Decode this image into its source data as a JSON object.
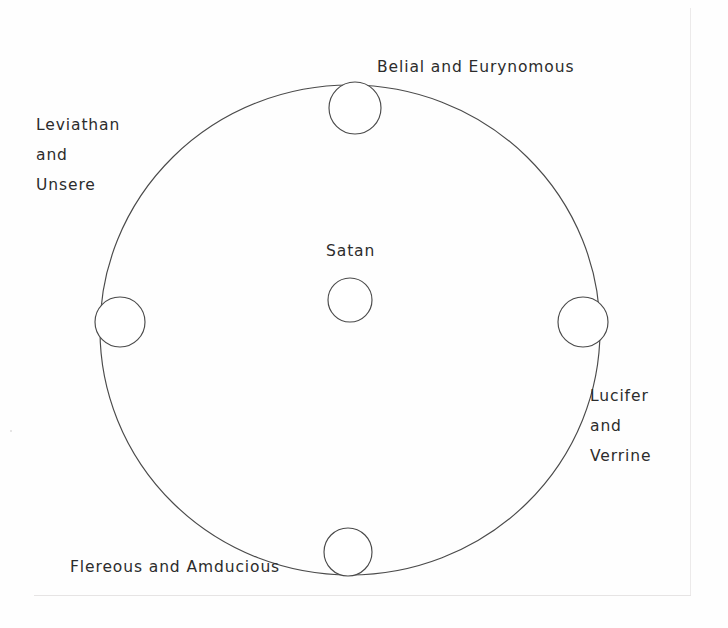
{
  "diagram": {
    "type": "circle-diagram",
    "stroke_color": "#4a4a4a",
    "text_color": "#2c2c2c",
    "background_color": "#fefefe",
    "center_node": {
      "id": "satan",
      "label": "Satan",
      "cx": 350,
      "cy": 300,
      "r": 22
    },
    "ring": {
      "cx": 350,
      "cy": 330,
      "rx": 250,
      "ry": 245
    },
    "nodes": [
      {
        "id": "north",
        "position": "top",
        "label": "Belial and Eurynomous",
        "label_lines": [
          "Belial and Eurynomous"
        ],
        "cx": 355,
        "cy": 108,
        "r": 26
      },
      {
        "id": "east",
        "position": "right",
        "label": "Lucifer and Verrine",
        "label_lines": [
          "Lucifer",
          "and",
          "Verrine"
        ],
        "cx": 583,
        "cy": 322,
        "r": 25
      },
      {
        "id": "south",
        "position": "bottom",
        "label": "Flereous and Amducious",
        "label_lines": [
          "Flereous and Amducious"
        ],
        "cx": 348,
        "cy": 552,
        "r": 24
      },
      {
        "id": "west",
        "position": "left",
        "label": "Leviathan and Unsere",
        "label_lines": [
          "Leviathan",
          "and",
          "Unsere"
        ],
        "cx": 120,
        "cy": 322,
        "r": 25
      }
    ]
  }
}
